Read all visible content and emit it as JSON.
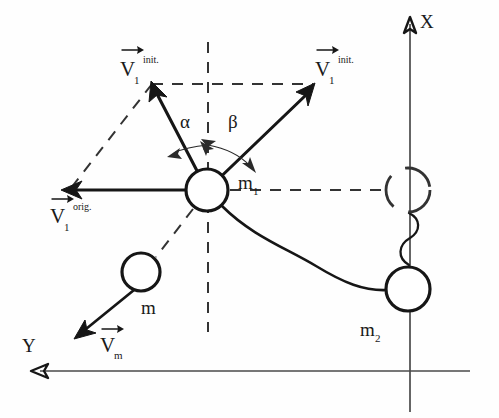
{
  "figure": {
    "background_color": "#fefefe",
    "ink_color": "#161616",
    "axis_color": "#4a4a4a",
    "construction_color": "#333333",
    "width": 499,
    "height": 418
  },
  "axes": {
    "x": {
      "label": "X",
      "label_x": 424,
      "label_y": 26,
      "tip_x": 410,
      "tip_y": 18,
      "tail_x": 410,
      "tail_y": 412,
      "direction": "up"
    },
    "y": {
      "label": "Y",
      "label_x": 24,
      "label_y": 352,
      "tip_x": 32,
      "tip_y": 371,
      "tail_x": 470,
      "tail_y": 371,
      "direction": "left"
    }
  },
  "bodies": [
    {
      "id": "m1",
      "label": "m",
      "subscript": "1",
      "label_x": 240,
      "label_y": 190,
      "cx": 207,
      "cy": 190,
      "r": 21,
      "style": "solid"
    },
    {
      "id": "m",
      "label": "m",
      "subscript": "",
      "label_x": 146,
      "label_y": 313,
      "cx": 141,
      "cy": 272,
      "r": 19,
      "style": "solid"
    },
    {
      "id": "m2",
      "label": "m",
      "subscript": "2",
      "label_x": 362,
      "label_y": 336,
      "cx": 408,
      "cy": 289,
      "r": 22,
      "style": "solid"
    },
    {
      "id": "m1-ghost",
      "label": "",
      "subscript": "",
      "label_x": 0,
      "label_y": 0,
      "cx": 408,
      "cy": 190,
      "r": 22,
      "style": "dashed"
    }
  ],
  "vectors": [
    {
      "id": "v1-init-left",
      "label": "V",
      "subscript": "1",
      "superscript": "init.",
      "label_x": 120,
      "label_y": 76,
      "tail_x": 207,
      "tail_y": 190,
      "tip_x": 152,
      "tip_y": 84
    },
    {
      "id": "v1-init-right",
      "label": "V",
      "subscript": "1",
      "superscript": "init.",
      "label_x": 315,
      "label_y": 76,
      "tail_x": 207,
      "tail_y": 190,
      "tip_x": 313,
      "tip_y": 85
    },
    {
      "id": "v1-orig",
      "label": "V",
      "subscript": "1",
      "superscript": "orig.",
      "label_x": 50,
      "label_y": 220,
      "tail_x": 207,
      "tail_y": 190,
      "tip_x": 62,
      "tip_y": 190
    },
    {
      "id": "vm",
      "label": "V",
      "subscript": "m",
      "superscript": "",
      "label_x": 100,
      "label_y": 351,
      "tail_x": 134,
      "tail_y": 290,
      "tip_x": 75,
      "tip_y": 338
    }
  ],
  "angles": [
    {
      "id": "alpha",
      "symbol": "α",
      "label_x": 180,
      "label_y": 127,
      "from": "vertical-dashed",
      "to": "v1-init-left"
    },
    {
      "id": "beta",
      "symbol": "β",
      "label_x": 229,
      "label_y": 127,
      "from": "vertical-dashed",
      "to": "v1-init-right"
    }
  ],
  "construction_lines": [
    {
      "id": "vertical-through-m1",
      "x1": 208,
      "y1": 42,
      "x2": 208,
      "y2": 332
    },
    {
      "id": "horizontal-top",
      "x1": 152,
      "y1": 84,
      "x2": 313,
      "y2": 84
    },
    {
      "id": "parallelogram-left-side",
      "x1": 152,
      "y1": 84,
      "x2": 68,
      "y2": 192
    },
    {
      "id": "horizontal-m1-to-ghost",
      "x1": 228,
      "y1": 190,
      "x2": 386,
      "y2": 190
    },
    {
      "id": "m1-to-m-link",
      "x1": 193,
      "y1": 208,
      "x2": 154,
      "y2": 258
    }
  ],
  "connectors": [
    {
      "id": "cord-m1-m2",
      "description": "flexible cord from m1 to m2"
    },
    {
      "id": "squiggle-ghost-m2",
      "description": "spring squiggle between ghost position and m2"
    }
  ]
}
